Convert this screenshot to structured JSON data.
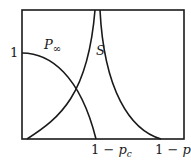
{
  "diagram": {
    "y_tick_label": "1",
    "curve_labels": {
      "p_infinity": {
        "symbol": "P",
        "subscript": "∞"
      },
      "s": "S"
    },
    "x_tick_labels": {
      "critical": {
        "prefix": "1 − ",
        "var": "p",
        "sub": "c"
      },
      "axis": {
        "prefix": "1 − ",
        "var": "p"
      }
    },
    "colors": {
      "line": "#1a1a1a",
      "background": "#ffffff"
    }
  }
}
